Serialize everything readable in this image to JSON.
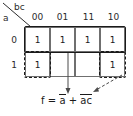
{
  "diagram": {
    "axis_labels": {
      "columns_var": "bc",
      "rows_var": "a"
    },
    "column_headers": [
      "00",
      "01",
      "11",
      "10"
    ],
    "row_headers": [
      "0",
      "1"
    ],
    "cells": [
      [
        "1",
        "1",
        "1",
        "1"
      ],
      [
        "1",
        "",
        "",
        "1"
      ]
    ],
    "groups": [
      {
        "name": "group-row-a0",
        "style": "solid",
        "term": "a-bar"
      },
      {
        "name": "group-wrap-ac-bar-left",
        "style": "dashed",
        "term": "a-c-bar"
      },
      {
        "name": "group-wrap-ac-bar-right",
        "style": "dashed",
        "term": "a-c-bar"
      }
    ],
    "expression": {
      "lhs": "f",
      "equals": "=",
      "term1_base": "a",
      "plus": "+",
      "term2_base": "ac",
      "full_text": "f = a̅ + ac̅"
    },
    "colors": {
      "ink": "#1a1a1a",
      "grid_line": "#6f6f6f",
      "background": "#ffffff"
    }
  }
}
